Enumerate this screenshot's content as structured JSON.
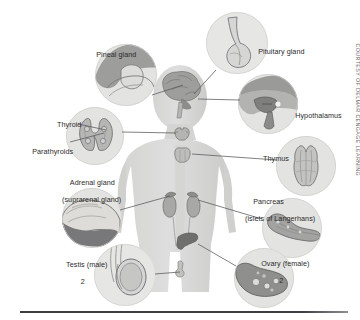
{
  "figure": {
    "credit": "COURTESY OF DELMAR CENGAGE LEARNING"
  },
  "colors": {
    "background": "#ffffff",
    "inset_circle": "#e3e3e1",
    "body_silhouette": "#d8d8d6",
    "body_silhouette_shadow": "#c9c9c7",
    "organ_mid": "#a9a9a7",
    "organ_dark": "#7e7e7e",
    "organ_light": "#d2d2d0",
    "leader_line": "#55575a",
    "label_text": "#2b2b2b",
    "rule": "#3c3e42"
  },
  "labels": [
    {
      "id": "pineal-gland",
      "name": "Pineal gland",
      "text": "Pineal gland",
      "sub": "",
      "count": "",
      "x": 88,
      "y": 42,
      "align": "left"
    },
    {
      "id": "pituitary-gland",
      "name": "Pituitary gland",
      "text": "Pituitary gland",
      "sub": "",
      "count": "",
      "x": 250,
      "y": 39,
      "align": "left"
    },
    {
      "id": "hypothalamus",
      "name": "Hypothalamus",
      "text": "Hypothalamus",
      "sub": "",
      "count": "",
      "x": 287,
      "y": 103,
      "align": "left"
    },
    {
      "id": "thyroid",
      "name": "Thyroid",
      "text": "Thyroid",
      "sub": "",
      "count": "",
      "x": 49,
      "y": 112,
      "align": "left"
    },
    {
      "id": "parathyroids",
      "name": "Parathyroids",
      "text": "Parathyroids",
      "sub": "",
      "count": "",
      "x": 24,
      "y": 143,
      "align": "left"
    },
    {
      "id": "thymus",
      "name": "Thymus",
      "text": "Thymus",
      "sub": "",
      "count": "",
      "x": 255,
      "y": 146,
      "align": "left"
    },
    {
      "id": "adrenal-gland",
      "name": "Adrenal gland",
      "text": "Adrenal gland",
      "sub": "(suprarenal gland)",
      "count": "",
      "x": 62,
      "y": 170,
      "align": "left"
    },
    {
      "id": "pancreas",
      "name": "Pancreas",
      "text": "Pancreas",
      "sub": "(islets of Langerhans)",
      "count": "",
      "x": 245,
      "y": 189,
      "align": "left"
    },
    {
      "id": "testis",
      "name": "Testis (male)",
      "text": "Testis (male)",
      "sub": "",
      "count": "2",
      "x": 58,
      "y": 252,
      "align": "left"
    },
    {
      "id": "ovary",
      "name": "Ovary (female)",
      "text": "Ovary (female)",
      "sub": "",
      "count": "2",
      "x": 253,
      "y": 251,
      "align": "left"
    }
  ],
  "insets": [
    {
      "id": "pineal-inset",
      "name": "pineal gland inset",
      "x": 95,
      "y": 44,
      "size": 62
    },
    {
      "id": "pituitary-inset",
      "name": "pituitary gland inset",
      "x": 206,
      "y": 12,
      "size": 62
    },
    {
      "id": "hypothalamus-inset",
      "name": "hypothalamus inset",
      "x": 238,
      "y": 74,
      "size": 60
    },
    {
      "id": "thyroid-inset",
      "name": "thyroid inset",
      "x": 66,
      "y": 107,
      "size": 58
    },
    {
      "id": "thymus-inset",
      "name": "thymus inset",
      "x": 276,
      "y": 136,
      "size": 60
    },
    {
      "id": "adrenal-inset",
      "name": "adrenal gland inset",
      "x": 62,
      "y": 188,
      "size": 60
    },
    {
      "id": "pancreas-inset",
      "name": "pancreas inset",
      "x": 262,
      "y": 198,
      "size": 60
    },
    {
      "id": "testis-inset",
      "name": "testis inset",
      "x": 94,
      "y": 244,
      "size": 62
    },
    {
      "id": "ovary-inset",
      "name": "ovary inset",
      "x": 234,
      "y": 248,
      "size": 60
    }
  ],
  "leaders": [
    {
      "id": "leader-pineal",
      "name": "pineal leader line",
      "x1": 155,
      "y1": 93,
      "x2": 183,
      "y2": 85
    },
    {
      "id": "leader-pituitary",
      "name": "pituitary leader line",
      "x1": 214,
      "y1": 72,
      "x2": 193,
      "y2": 95
    },
    {
      "id": "leader-hypothalamus",
      "name": "hypothalamus leader line",
      "x1": 240,
      "y1": 101,
      "x2": 196,
      "y2": 99
    },
    {
      "id": "leader-thyroid",
      "name": "thyroid leader line",
      "x1": 77,
      "y1": 125,
      "x2": 122,
      "y2": 122
    },
    {
      "id": "leader-thyroid2",
      "name": "thyroid organ leader",
      "x1": 123,
      "y1": 122,
      "x2": 186,
      "y2": 131
    },
    {
      "id": "leader-parathyroid",
      "name": "parathyroid leader line",
      "x1": 70,
      "y1": 143,
      "x2": 118,
      "y2": 127
    },
    {
      "id": "leader-thymus",
      "name": "thymus leader line",
      "x1": 276,
      "y1": 162,
      "x2": 196,
      "y2": 154
    },
    {
      "id": "leader-adrenal",
      "name": "adrenal leader line",
      "x1": 120,
      "y1": 209,
      "x2": 178,
      "y2": 194
    },
    {
      "id": "leader-pancreas",
      "name": "pancreas leader line",
      "x1": 262,
      "y1": 216,
      "x2": 197,
      "y2": 199
    },
    {
      "id": "leader-testis",
      "name": "testis leader line",
      "x1": 155,
      "y1": 272,
      "x2": 186,
      "y2": 272
    },
    {
      "id": "leader-ovary",
      "name": "ovary leader line",
      "x1": 234,
      "y1": 265,
      "x2": 200,
      "y2": 245
    }
  ]
}
